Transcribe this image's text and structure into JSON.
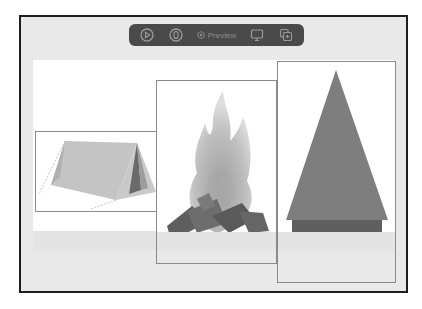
{
  "toolbar": {
    "buttons": [
      {
        "name": "play-button",
        "icon": "play-circle-icon"
      },
      {
        "name": "live-button",
        "icon": "capsule-circle-icon"
      }
    ],
    "preview_label": "Preview",
    "preview_icon": "preview-target-icon",
    "right_buttons": [
      {
        "name": "device-button",
        "icon": "monitor-icon"
      },
      {
        "name": "duplicate-button",
        "icon": "duplicate-icon"
      }
    ]
  },
  "canvas": {
    "items": [
      {
        "name": "tent-image",
        "description": "tent"
      },
      {
        "name": "campfire-image",
        "description": "campfire"
      },
      {
        "name": "tree-image",
        "description": "tree"
      }
    ]
  },
  "colors": {
    "frame_border": "#1e1e1e",
    "frame_bg": "#e9e9e9",
    "toolbar_bg": "#4a4a4a",
    "toolbar_fg": "#8c8c8c",
    "canvas_bg": "#ffffff",
    "item_border": "#8a8a8a"
  }
}
